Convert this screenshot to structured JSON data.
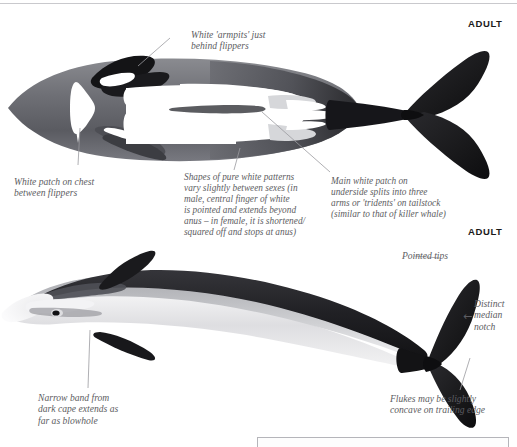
{
  "page": {
    "width": 517,
    "height": 447,
    "background": "#ffffff",
    "rule_color": "#c9c9cd"
  },
  "labels": {
    "adult_top": "ADULT",
    "adult_bottom": "ADULT"
  },
  "top_figure": {
    "view": "ventral",
    "callouts": [
      {
        "id": "white-armpits",
        "text": "White 'armpits' just\nbehind flippers"
      },
      {
        "id": "white-patch-chest",
        "text": "White patch on chest\nbetween flippers"
      },
      {
        "id": "white-pattern-variation",
        "text": "Shapes of pure white patterns\nvary slightly between sexes (in\nmale, central finger of white\nis pointed and extends beyond\nanus – in female, it is shortened/\nsquared off and stops at anus)"
      },
      {
        "id": "main-white-patch",
        "text": "Main white patch on\nunderside splits into three\narms or 'tridents' on tailstock\n(similar to that of killer whale)"
      }
    ]
  },
  "bottom_figure": {
    "view": "lateral",
    "callouts": [
      {
        "id": "pointed-tips",
        "text": "Pointed tips"
      },
      {
        "id": "median-notch",
        "text": "Distinct\nmedian\nnotch",
        "arrow": "←"
      },
      {
        "id": "narrow-band",
        "text": "Narrow band from\ndark cape extends as\nfar as blowhole"
      },
      {
        "id": "flukes-concave",
        "text": "Flukes may be slightly\nconcave on trailing edge"
      }
    ]
  },
  "colors": {
    "body_dark": "#1b1b1d",
    "body_mid": "#6f7076",
    "body_light": "#e8e8ea",
    "white": "#ffffff",
    "caption_text": "#5d5d62",
    "leader_line": "#9b9ba0",
    "box_border": "#b5b5ba"
  }
}
